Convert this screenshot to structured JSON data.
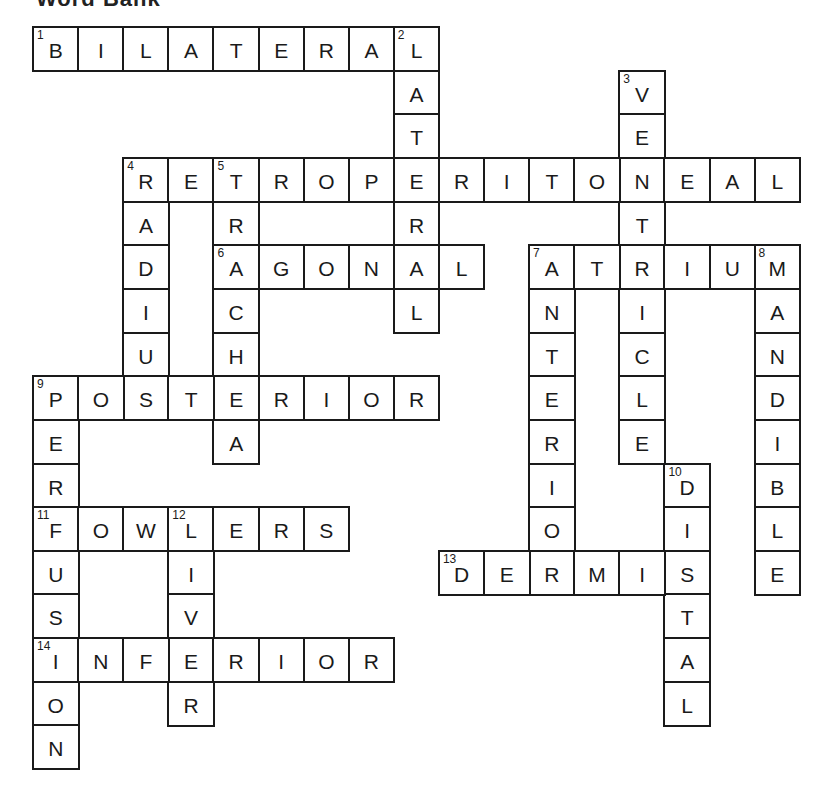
{
  "heading": "Word Bank",
  "grid": {
    "origin_x": 33,
    "origin_y": 27,
    "cell_w": 45.1,
    "cell_h": 43.65,
    "cols": 17,
    "rows": 17
  },
  "words": [
    {
      "number": 1,
      "direction": "across",
      "answer": "BILATERAL",
      "row": 0,
      "col": 0
    },
    {
      "number": 2,
      "direction": "down",
      "answer": "LATERAL",
      "row": 0,
      "col": 8
    },
    {
      "number": 3,
      "direction": "down",
      "answer": "VENTRICLE",
      "row": 1,
      "col": 13
    },
    {
      "number": 4,
      "direction": "across",
      "answer": "RETROPERITONEAL",
      "row": 3,
      "col": 2
    },
    {
      "number": 4,
      "direction": "down",
      "answer": "RADIUS",
      "row": 3,
      "col": 2
    },
    {
      "number": 5,
      "direction": "down",
      "answer": "TRACHEA",
      "row": 3,
      "col": 4
    },
    {
      "number": 6,
      "direction": "across",
      "answer": "AGONAL",
      "row": 5,
      "col": 4
    },
    {
      "number": 7,
      "direction": "across",
      "answer": "ATRIUM",
      "row": 5,
      "col": 11
    },
    {
      "number": 7,
      "direction": "down",
      "answer": "ANTERIOR",
      "row": 5,
      "col": 11
    },
    {
      "number": 8,
      "direction": "down",
      "answer": "MANDIBLE",
      "row": 5,
      "col": 16
    },
    {
      "number": 9,
      "direction": "across",
      "answer": "POSTERIOR",
      "row": 8,
      "col": 0
    },
    {
      "number": 9,
      "direction": "down",
      "answer": "PERFUSION",
      "row": 8,
      "col": 0
    },
    {
      "number": 10,
      "direction": "down",
      "answer": "DISTAL",
      "row": 10,
      "col": 14
    },
    {
      "number": 11,
      "direction": "across",
      "answer": "FOWLERS",
      "row": 11,
      "col": 0
    },
    {
      "number": 12,
      "direction": "down",
      "answer": "LIVER",
      "row": 11,
      "col": 3
    },
    {
      "number": 13,
      "direction": "across",
      "answer": "DERMIS",
      "row": 12,
      "col": 9
    },
    {
      "number": 14,
      "direction": "across",
      "answer": "INFERIOR",
      "row": 14,
      "col": 0
    }
  ]
}
